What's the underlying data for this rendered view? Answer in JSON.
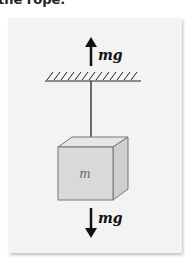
{
  "caption": "the rope.",
  "diagram": {
    "upper_force_label": "mg",
    "lower_force_label": "mg",
    "mass_label": "m",
    "colors": {
      "panel_bg": "#f3f3f3",
      "cube_front": "#d9d9d9",
      "cube_top": "#e6e6e6",
      "cube_side": "#cfcfcf",
      "cube_edge": "#777777",
      "line": "#111111"
    }
  }
}
